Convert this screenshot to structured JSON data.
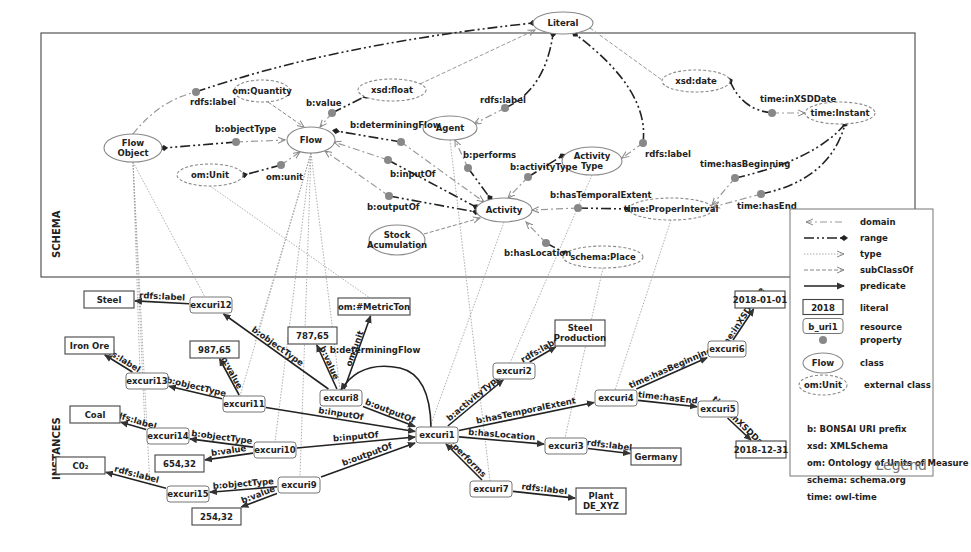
{
  "sections": {
    "schema_label": "SCHEMA",
    "instances_label": "INSTANCES"
  },
  "schema_box": {
    "x": 41,
    "y": 33,
    "w": 874,
    "h": 244
  },
  "schema_classes": [
    {
      "id": "literal",
      "label": "Literal",
      "x": 563,
      "y": 23,
      "rx": 30,
      "ry": 11,
      "style": "solid"
    },
    {
      "id": "om_quantity",
      "label": "om:Quantity",
      "x": 262,
      "y": 91,
      "rx": 28,
      "ry": 11,
      "style": "dashed"
    },
    {
      "id": "xsd_float",
      "label": "xsd:float",
      "x": 392,
      "y": 90,
      "rx": 34,
      "ry": 11,
      "style": "dashed"
    },
    {
      "id": "xsd_date",
      "label": "xsd:date",
      "x": 696,
      "y": 81,
      "rx": 34,
      "ry": 11,
      "style": "dashed"
    },
    {
      "id": "time_instant",
      "label": "time:Instant",
      "x": 840,
      "y": 113,
      "rx": 35,
      "ry": 11,
      "style": "dashed"
    },
    {
      "id": "flow_object",
      "label": "Flow\nObject",
      "x": 133,
      "y": 148,
      "rx": 29,
      "ry": 14,
      "style": "solid"
    },
    {
      "id": "flow",
      "label": "Flow",
      "x": 311,
      "y": 140,
      "rx": 24,
      "ry": 13,
      "style": "solid"
    },
    {
      "id": "agent",
      "label": "Agent",
      "x": 450,
      "y": 128,
      "rx": 27,
      "ry": 12,
      "style": "solid"
    },
    {
      "id": "activity_type",
      "label": "Activity\nType",
      "x": 592,
      "y": 161,
      "rx": 30,
      "ry": 14,
      "style": "solid"
    },
    {
      "id": "om_unit",
      "label": "om:Unit",
      "x": 210,
      "y": 175,
      "rx": 33,
      "ry": 11,
      "style": "dashed"
    },
    {
      "id": "activity",
      "label": "Activity",
      "x": 504,
      "y": 210,
      "rx": 28,
      "ry": 12,
      "style": "solid"
    },
    {
      "id": "time_proper_interval",
      "label": "time:ProperInterval",
      "x": 671,
      "y": 209,
      "rx": 42,
      "ry": 11,
      "style": "dashed"
    },
    {
      "id": "stock_accumulation",
      "label": "Stock\nAcumulation",
      "x": 397,
      "y": 240,
      "rx": 28,
      "ry": 15,
      "style": "solid"
    },
    {
      "id": "schema_place",
      "label": "schema:Place",
      "x": 603,
      "y": 257,
      "rx": 40,
      "ry": 11,
      "style": "dashed"
    }
  ],
  "schema_properties": [
    {
      "label": "rdfs:label",
      "dot": [
        196,
        92
      ],
      "lx": 190,
      "ly": 105
    },
    {
      "label": "b:value",
      "dot": [
        332,
        113
      ],
      "lx": 306,
      "ly": 106
    },
    {
      "label": "b:objectType",
      "dot": [
        236,
        142
      ],
      "lx": 215,
      "ly": 132
    },
    {
      "label": "b:determiningFlow",
      "dot": [
        401,
        142
      ],
      "lx": 350,
      "ly": 128
    },
    {
      "label": "rdfs:label",
      "dot": [
        505,
        108
      ],
      "lx": 480,
      "ly": 103
    },
    {
      "label": "om:unit",
      "dot": [
        281,
        165
      ],
      "lx": 266,
      "ly": 180
    },
    {
      "label": "b:inputOf",
      "dot": [
        388,
        160
      ],
      "lx": 390,
      "ly": 177
    },
    {
      "label": "b:performs",
      "dot": [
        468,
        168
      ],
      "lx": 463,
      "ly": 158
    },
    {
      "label": "b:activityType",
      "dot": [
        528,
        177
      ],
      "lx": 510,
      "ly": 170
    },
    {
      "label": "rdfs:label",
      "dot": [
        643,
        143
      ],
      "lx": 645,
      "ly": 157
    },
    {
      "label": "time:inXSDDate",
      "dot": [
        772,
        113
      ],
      "lx": 760,
      "ly": 102
    },
    {
      "label": "time:hasBeginning",
      "dot": [
        735,
        178
      ],
      "lx": 700,
      "ly": 167
    },
    {
      "label": "time:hasEnd",
      "dot": [
        761,
        194
      ],
      "lx": 737,
      "ly": 209
    },
    {
      "label": "b:outputOf",
      "dot": [
        389,
        196
      ],
      "lx": 367,
      "ly": 210
    },
    {
      "label": "b:hasTemporalExtent",
      "dot": [
        578,
        208
      ],
      "lx": 550,
      "ly": 198
    },
    {
      "label": "b:hasLocation",
      "dot": [
        546,
        243
      ],
      "lx": 504,
      "ly": 256
    }
  ],
  "instances": {
    "resources": [
      {
        "id": "excuri12",
        "label": "excuri12",
        "x": 190,
        "y": 297,
        "w": 42,
        "h": 16
      },
      {
        "id": "excuri13",
        "label": "excuri13",
        "x": 126,
        "y": 373,
        "w": 42,
        "h": 16
      },
      {
        "id": "excuri11",
        "label": "excuri11",
        "x": 223,
        "y": 396,
        "w": 42,
        "h": 16
      },
      {
        "id": "excuri8",
        "label": "excuri8",
        "x": 320,
        "y": 390,
        "w": 42,
        "h": 16
      },
      {
        "id": "excuri14",
        "label": "excuri14",
        "x": 147,
        "y": 428,
        "w": 42,
        "h": 16
      },
      {
        "id": "excuri10",
        "label": "excuri10",
        "x": 254,
        "y": 442,
        "w": 42,
        "h": 16
      },
      {
        "id": "excuri9",
        "label": "excuri9",
        "x": 278,
        "y": 477,
        "w": 42,
        "h": 16
      },
      {
        "id": "excuri15",
        "label": "excuri15",
        "x": 167,
        "y": 486,
        "w": 42,
        "h": 16
      },
      {
        "id": "excuri1",
        "label": "excuri1",
        "x": 416,
        "y": 427,
        "w": 42,
        "h": 16
      },
      {
        "id": "excuri2",
        "label": "excuri2",
        "x": 493,
        "y": 363,
        "w": 42,
        "h": 16
      },
      {
        "id": "excuri4",
        "label": "excuri4",
        "x": 595,
        "y": 390,
        "w": 42,
        "h": 16
      },
      {
        "id": "excuri3",
        "label": "excuri3",
        "x": 545,
        "y": 438,
        "w": 42,
        "h": 16
      },
      {
        "id": "excuri7",
        "label": "excuri7",
        "x": 470,
        "y": 481,
        "w": 42,
        "h": 16
      },
      {
        "id": "excuri6",
        "label": "excuri6",
        "x": 708,
        "y": 341,
        "w": 38,
        "h": 16
      },
      {
        "id": "excuri5",
        "label": "excuri5",
        "x": 698,
        "y": 401,
        "w": 40,
        "h": 16
      }
    ],
    "literals": [
      {
        "id": "steel",
        "label": "Steel",
        "x": 84,
        "y": 291,
        "w": 50,
        "h": 17
      },
      {
        "id": "iron_ore",
        "label": "Iron Ore",
        "x": 65,
        "y": 337,
        "w": 49,
        "h": 17
      },
      {
        "id": "coal",
        "label": "Coal",
        "x": 70,
        "y": 406,
        "w": 50,
        "h": 17
      },
      {
        "id": "co2",
        "label": "C0₂",
        "x": 56,
        "y": 457,
        "w": 49,
        "h": 17
      },
      {
        "id": "v98765",
        "label": "987,65",
        "x": 190,
        "y": 341,
        "w": 49,
        "h": 17
      },
      {
        "id": "v78765",
        "label": "787,65",
        "x": 288,
        "y": 327,
        "w": 49,
        "h": 17
      },
      {
        "id": "metric_ton",
        "label": "om:#MetricTon",
        "x": 338,
        "y": 298,
        "w": 72,
        "h": 17
      },
      {
        "id": "v65432",
        "label": "654,32",
        "x": 155,
        "y": 455,
        "w": 49,
        "h": 17
      },
      {
        "id": "v25432",
        "label": "254,32",
        "x": 192,
        "y": 508,
        "w": 49,
        "h": 17
      },
      {
        "id": "steel_production",
        "label": "Steel\nProduction",
        "x": 555,
        "y": 320,
        "w": 50,
        "h": 26
      },
      {
        "id": "germany",
        "label": "Germany",
        "x": 631,
        "y": 448,
        "w": 50,
        "h": 17
      },
      {
        "id": "plant_de_xyz",
        "label": "Plant\nDE_XYZ",
        "x": 576,
        "y": 488,
        "w": 50,
        "h": 26
      },
      {
        "id": "d20180101",
        "label": "2018-01-01",
        "x": 735,
        "y": 291,
        "w": 50,
        "h": 17
      },
      {
        "id": "d20181231",
        "label": "2018-12-31",
        "x": 736,
        "y": 441,
        "w": 50,
        "h": 17
      }
    ],
    "edges": [
      {
        "from": "excuri12",
        "to": "steel",
        "label": "rdfs:label"
      },
      {
        "from": "excuri8",
        "to": "excuri12",
        "label": "b:objectType"
      },
      {
        "from": "excuri13",
        "to": "iron_ore",
        "label": "rdfs:label"
      },
      {
        "from": "excuri11",
        "to": "excuri13",
        "label": "b:objectType"
      },
      {
        "from": "excuri11",
        "to": "v98765",
        "label": "b:value"
      },
      {
        "from": "excuri8",
        "to": "v78765",
        "label": "b:value"
      },
      {
        "from": "excuri8",
        "to": "metric_ton",
        "label": "om:unit"
      },
      {
        "from": "excuri14",
        "to": "coal",
        "label": "rdfs:label"
      },
      {
        "from": "excuri10",
        "to": "excuri14",
        "label": "b:objectType"
      },
      {
        "from": "excuri10",
        "to": "v65432",
        "label": "b:value"
      },
      {
        "from": "excuri15",
        "to": "co2",
        "label": "rdfs:label"
      },
      {
        "from": "excuri9",
        "to": "excuri15",
        "label": "b:objectType"
      },
      {
        "from": "excuri9",
        "to": "v25432",
        "label": "b:value"
      },
      {
        "from": "excuri11",
        "to": "excuri1",
        "label": "b:inputOf"
      },
      {
        "from": "excuri10",
        "to": "excuri1",
        "label": "b:inputOf"
      },
      {
        "from": "excuri8",
        "to": "excuri1",
        "label": "b:outputOf"
      },
      {
        "from": "excuri9",
        "to": "excuri1",
        "label": "b:outputOf"
      },
      {
        "from": "excuri1",
        "to": "excuri8",
        "label": "b:determiningFlow"
      },
      {
        "from": "excuri1",
        "to": "excuri2",
        "label": "b:activityType"
      },
      {
        "from": "excuri2",
        "to": "steel_production",
        "label": "rdfs:label"
      },
      {
        "from": "excuri1",
        "to": "excuri4",
        "label": "b:hasTemporalExtent"
      },
      {
        "from": "excuri1",
        "to": "excuri3",
        "label": "b:hasLocation"
      },
      {
        "from": "excuri3",
        "to": "germany",
        "label": "rdfs:label"
      },
      {
        "from": "excuri7",
        "to": "excuri1",
        "label": "b:performs"
      },
      {
        "from": "excuri7",
        "to": "plant_de_xyz",
        "label": "rdfs:label"
      },
      {
        "from": "excuri4",
        "to": "excuri6",
        "label": "time:hasBeginning"
      },
      {
        "from": "excuri4",
        "to": "excuri5",
        "label": "time:hasEnd"
      },
      {
        "from": "excuri6",
        "to": "d20180101",
        "label": "time:inXSDDate"
      },
      {
        "from": "excuri5",
        "to": "d20181231",
        "label": "time:inXSDDate"
      }
    ]
  },
  "legend": {
    "title": "Legend",
    "items": [
      {
        "symbol": "domain",
        "label": "domain"
      },
      {
        "symbol": "range",
        "label": "range"
      },
      {
        "symbol": "type",
        "label": "type"
      },
      {
        "symbol": "subClassOf",
        "label": "subClassOf"
      },
      {
        "symbol": "predicate",
        "label": "predicate"
      },
      {
        "symbol": "literal",
        "sample": "2018",
        "label": "literal"
      },
      {
        "symbol": "resource",
        "sample": "b_uri1",
        "label": "resource"
      },
      {
        "symbol": "property",
        "label": "property"
      },
      {
        "symbol": "class",
        "sample": "Flow",
        "label": "class"
      },
      {
        "symbol": "external_class",
        "sample": "om:Unit",
        "label": "external class"
      }
    ],
    "prefixes": [
      {
        "prefix": "b:",
        "meaning": "BONSAI URI prefix"
      },
      {
        "prefix": "xsd:",
        "meaning": "XMLSchema"
      },
      {
        "prefix": "om:",
        "meaning": "Ontology of Units of Measure"
      },
      {
        "prefix": "schema:",
        "meaning": "schema.org"
      },
      {
        "prefix": "time:",
        "meaning": "owl-time"
      }
    ]
  },
  "colors": {
    "line": "#333333",
    "dotted": "#888888",
    "property_dot": "#888888",
    "box_border": "#555555"
  }
}
